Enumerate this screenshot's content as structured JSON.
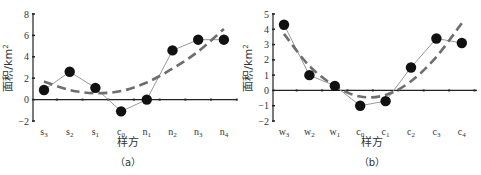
{
  "chart_data": [
    {
      "type": "line",
      "panel": "(a)",
      "title": "",
      "xlabel": "样方",
      "ylabel": "面积/km²",
      "ylim": [
        -2,
        8
      ],
      "yticks": [
        -2,
        0,
        2,
        4,
        6,
        8
      ],
      "categories": [
        "s3",
        "s2",
        "s1",
        "c0",
        "n1",
        "n2",
        "n3",
        "n4"
      ],
      "category_labels": [
        {
          "base": "s",
          "sub": "3"
        },
        {
          "base": "s",
          "sub": "2"
        },
        {
          "base": "s",
          "sub": "1"
        },
        {
          "base": "c",
          "sub": "0"
        },
        {
          "base": "n",
          "sub": "1"
        },
        {
          "base": "n",
          "sub": "2"
        },
        {
          "base": "n",
          "sub": "3"
        },
        {
          "base": "n",
          "sub": "4"
        }
      ],
      "series": [
        {
          "name": "observed",
          "style": "solid-line-with-markers",
          "values": [
            0.9,
            2.6,
            1.1,
            -1.1,
            0.0,
            4.6,
            5.6,
            5.6
          ]
        },
        {
          "name": "trend",
          "style": "dashed",
          "values": [
            1.7,
            0.9,
            0.6,
            0.8,
            1.6,
            2.9,
            4.5,
            6.6
          ]
        }
      ],
      "grid": false,
      "legend": "none",
      "zero_line": true
    },
    {
      "type": "line",
      "panel": "(b)",
      "title": "",
      "xlabel": "样方",
      "ylabel": "面积/km²",
      "ylim": [
        -2,
        5
      ],
      "yticks": [
        -2,
        -1,
        0,
        1,
        2,
        3,
        4,
        5
      ],
      "categories": [
        "w3",
        "w2",
        "w1",
        "c0",
        "c1",
        "c2",
        "c3",
        "c4"
      ],
      "category_labels": [
        {
          "base": "w",
          "sub": "3"
        },
        {
          "base": "w",
          "sub": "2"
        },
        {
          "base": "w",
          "sub": "1"
        },
        {
          "base": "c",
          "sub": "0"
        },
        {
          "base": "c",
          "sub": "1"
        },
        {
          "base": "c",
          "sub": "2"
        },
        {
          "base": "c",
          "sub": "3"
        },
        {
          "base": "c",
          "sub": "4"
        }
      ],
      "series": [
        {
          "name": "observed",
          "style": "solid-line-with-markers",
          "values": [
            4.3,
            1.0,
            0.3,
            -1.0,
            -0.7,
            1.5,
            3.4,
            3.1
          ]
        },
        {
          "name": "trend",
          "style": "dashed",
          "values": [
            3.7,
            1.6,
            0.3,
            -0.4,
            -0.3,
            0.6,
            2.2,
            4.4
          ]
        }
      ],
      "grid": false,
      "legend": "none",
      "zero_line": true
    }
  ],
  "colors": {
    "marker": "#111111",
    "observed_line": "#9a9a9a",
    "trend_line": "#6e6e6e",
    "axis": "#222222",
    "text": "#333333"
  }
}
